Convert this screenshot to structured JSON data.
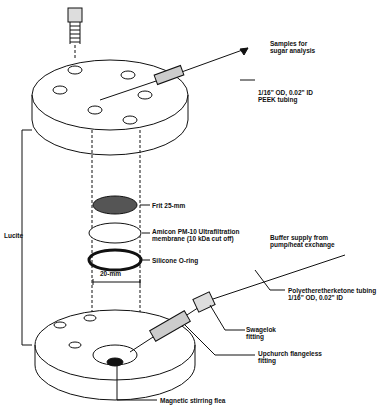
{
  "labels": {
    "samples": "Samples for\nsugar analysis",
    "peek": "1/16\" OD, 0.02\" ID\nPEEK tubing",
    "frit": "Frit 25-mm",
    "membrane": "Amicon PM-10 Ultrafiltration\nmembrane (10 kDa cut off)",
    "oring": "Silicone O-ring",
    "buffer": "Buffer supply from\npump/heat exchange",
    "peek2": "Polyetheretherketone tubing\n1/16\" OD, 0.02\" ID",
    "swagelok": "Swagelok\nfitting",
    "upchurch": "Upchurch flangeless\nfitting",
    "lucite": "Lucite",
    "dim": "20-mm",
    "stir": "Magnetic stirring flea"
  }
}
